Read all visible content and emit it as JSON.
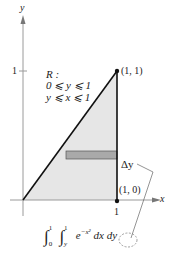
{
  "axes": {
    "x_label": "x",
    "y_label": "y",
    "x_tick": "1",
    "y_tick": "1"
  },
  "region": {
    "name": "R :",
    "constraint_1": "0 ⩽ y ⩽ 1",
    "constraint_2": "y ⩽ x ⩽ 1",
    "vertices": [
      [
        0,
        0
      ],
      [
        1,
        1
      ],
      [
        1,
        0
      ]
    ],
    "fill_color": "#e6e6e6",
    "strip_color": "#a9a9a9"
  },
  "points": {
    "p1_label": "(1, 1)",
    "p2_label": "(1, 0)"
  },
  "strip": {
    "label": "Δy"
  },
  "integral": {
    "outer_lower": "0",
    "outer_upper": "1",
    "inner_lower": "y",
    "inner_upper": "1",
    "integrand": "e",
    "exponent": "−x²",
    "dx": "dx",
    "dy": "dy"
  }
}
